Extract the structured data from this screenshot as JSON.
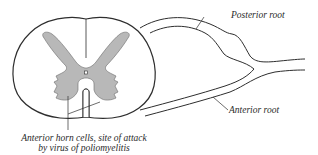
{
  "figure": {
    "colors": {
      "line": "#2e2e2e",
      "gray_matter": "#b8b8b8",
      "background": "#ffffff"
    },
    "labels": {
      "posterior_root": "Posterior root",
      "anterior_root": "Anterior root",
      "anterior_horn_line1": "Anterior horn cells, site of attack",
      "anterior_horn_line2": "by virus of poliomyelitis"
    }
  }
}
